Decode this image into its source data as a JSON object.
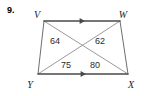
{
  "problem": {
    "number": "9."
  },
  "figure": {
    "shape_name": "trapezoid",
    "stroke_color_outer": "#6f6f6f",
    "stroke_color_parallel": "#4a4a4a",
    "stroke_color_diagonal": "#9a9a9a",
    "vertices": [
      {
        "id": "V",
        "label": "V",
        "x": 44,
        "y": 21,
        "label_x": 37,
        "label_y": 16
      },
      {
        "id": "W",
        "label": "W",
        "x": 120,
        "y": 21,
        "label_x": 123,
        "label_y": 16
      },
      {
        "id": "X",
        "label": "X",
        "x": 128,
        "y": 74,
        "label_x": 131,
        "label_y": 86
      },
      {
        "id": "Y",
        "label": "Y",
        "x": 38,
        "y": 74,
        "label_x": 30,
        "label_y": 86
      }
    ],
    "angle_labels": [
      {
        "id": "angle-at-v",
        "value": "64",
        "x": 55,
        "y": 42
      },
      {
        "id": "angle-at-w",
        "value": "62",
        "x": 100,
        "y": 42
      },
      {
        "id": "angle-at-y",
        "value": "75",
        "x": 66,
        "y": 66
      },
      {
        "id": "angle-at-x",
        "value": "80",
        "x": 95,
        "y": 66
      }
    ],
    "parallel_marks": [
      {
        "id": "top-edge-arrow",
        "edge": "VW",
        "x": 83,
        "y": 21,
        "direction": "right"
      },
      {
        "id": "bottom-edge-arrow",
        "edge": "YX",
        "x": 84,
        "y": 74,
        "direction": "right"
      }
    ],
    "edges": [
      {
        "id": "edge-VW",
        "from": "V",
        "to": "W",
        "style": "parallel"
      },
      {
        "id": "edge-WX",
        "from": "W",
        "to": "X",
        "style": "plain"
      },
      {
        "id": "edge-XY",
        "from": "X",
        "to": "Y",
        "style": "parallel"
      },
      {
        "id": "edge-YV",
        "from": "Y",
        "to": "V",
        "style": "plain"
      }
    ],
    "diagonals": [
      {
        "id": "diagonal-VX",
        "from": "V",
        "to": "X"
      },
      {
        "id": "diagonal-WY",
        "from": "W",
        "to": "Y"
      }
    ]
  }
}
